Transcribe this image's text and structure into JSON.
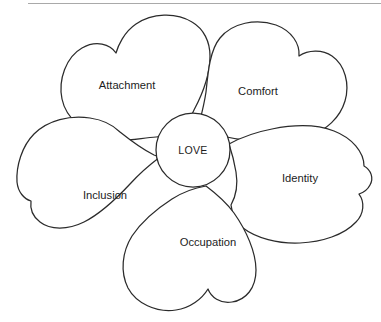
{
  "diagram": {
    "type": "petal-diagram",
    "stroke_color": "#2b2b2b",
    "fill_color": "#ffffff",
    "text_color": "#1c1c1c",
    "rule_color": "#a9a9a9",
    "core": {
      "label": "LOVE",
      "cx": 193,
      "cy": 150,
      "r": 37
    },
    "petals": [
      {
        "id": "attachment",
        "label": "Attachment",
        "label_x": 127,
        "label_y": 86,
        "position": "top-left"
      },
      {
        "id": "comfort",
        "label": "Comfort",
        "label_x": 258,
        "label_y": 92,
        "position": "top-right"
      },
      {
        "id": "identity",
        "label": "Identity",
        "label_x": 300,
        "label_y": 179,
        "position": "right"
      },
      {
        "id": "occupation",
        "label": "Occupation",
        "label_x": 208,
        "label_y": 243,
        "position": "bottom"
      },
      {
        "id": "inclusion",
        "label": "Inclusion",
        "label_x": 105,
        "label_y": 196,
        "position": "left"
      }
    ]
  }
}
